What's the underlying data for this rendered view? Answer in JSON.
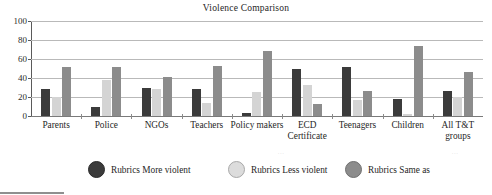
{
  "chart_data": {
    "type": "bar",
    "title": "Violence Comparison",
    "xlabel": "",
    "ylabel": "",
    "ylim": [
      0,
      100
    ],
    "yticks": [
      0,
      20,
      40,
      60,
      80,
      100
    ],
    "grid": true,
    "legend_position": "bottom",
    "categories": [
      "Parents",
      "Police",
      "NGOs",
      "Teachers",
      "Policy makers",
      "ECD Certificate",
      "Teenagers",
      "Children",
      "All T&T groups"
    ],
    "category_lines": [
      [
        "Parents",
        ""
      ],
      [
        "Police",
        ""
      ],
      [
        "NGOs",
        ""
      ],
      [
        "Teachers",
        ""
      ],
      [
        "Policy makers",
        ""
      ],
      [
        "ECD",
        "Certificate"
      ],
      [
        "Teenagers",
        ""
      ],
      [
        "Children",
        ""
      ],
      [
        "All T&T",
        "groups"
      ]
    ],
    "series": [
      {
        "name": "Rubrics More violent",
        "color": "#3b3b3b",
        "values": [
          28,
          9,
          29,
          28,
          3,
          49,
          52,
          18,
          26
        ]
      },
      {
        "name": "Rubrics Less violent",
        "color": "#d4d4d4",
        "values": [
          20,
          38,
          28,
          14,
          25,
          33,
          17,
          2,
          20
        ]
      },
      {
        "name": "Rubrics Same as",
        "color": "#8c8c8c",
        "values": [
          52,
          52,
          41,
          53,
          68,
          13,
          26,
          74,
          46
        ]
      }
    ]
  },
  "legend": {
    "items": [
      {
        "label": "Rubrics More violent",
        "swatch": "series-0-swatch"
      },
      {
        "label": "Rubrics Less violent",
        "swatch": "series-1-swatch"
      },
      {
        "label": "Rubrics Same as",
        "swatch": "series-2-swatch"
      }
    ]
  },
  "artifacts": {
    "mark_a": "...",
    "mark_b": "..."
  }
}
